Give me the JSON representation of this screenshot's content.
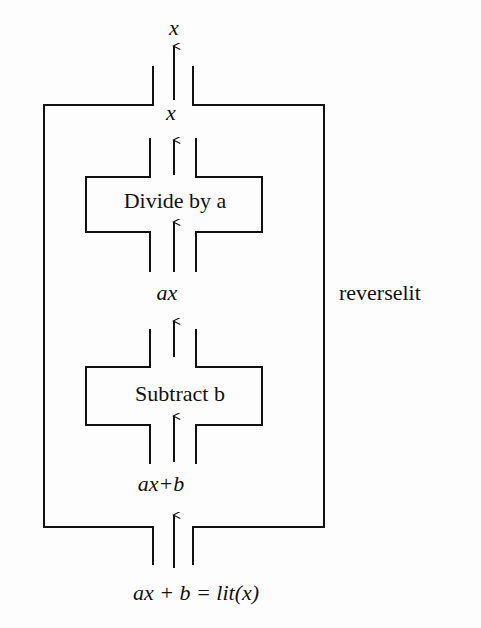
{
  "diagram": {
    "type": "nested-process-flow",
    "outer_block": {
      "label": "reverselit"
    },
    "steps": [
      {
        "label": "Subtract b",
        "input": "ax+b",
        "output": "ax"
      },
      {
        "label": "Divide by a",
        "input": "ax",
        "output": "x"
      }
    ],
    "labels": {
      "input_bottom": "ax + b = lit(x)",
      "between_outer_and_subtract": "ax+b",
      "between_subtract_and_divide": "ax",
      "between_divide_and_outer": "x",
      "output_top": "x"
    },
    "colors": {
      "line": "#111111",
      "background": "#fdfdfd"
    }
  }
}
